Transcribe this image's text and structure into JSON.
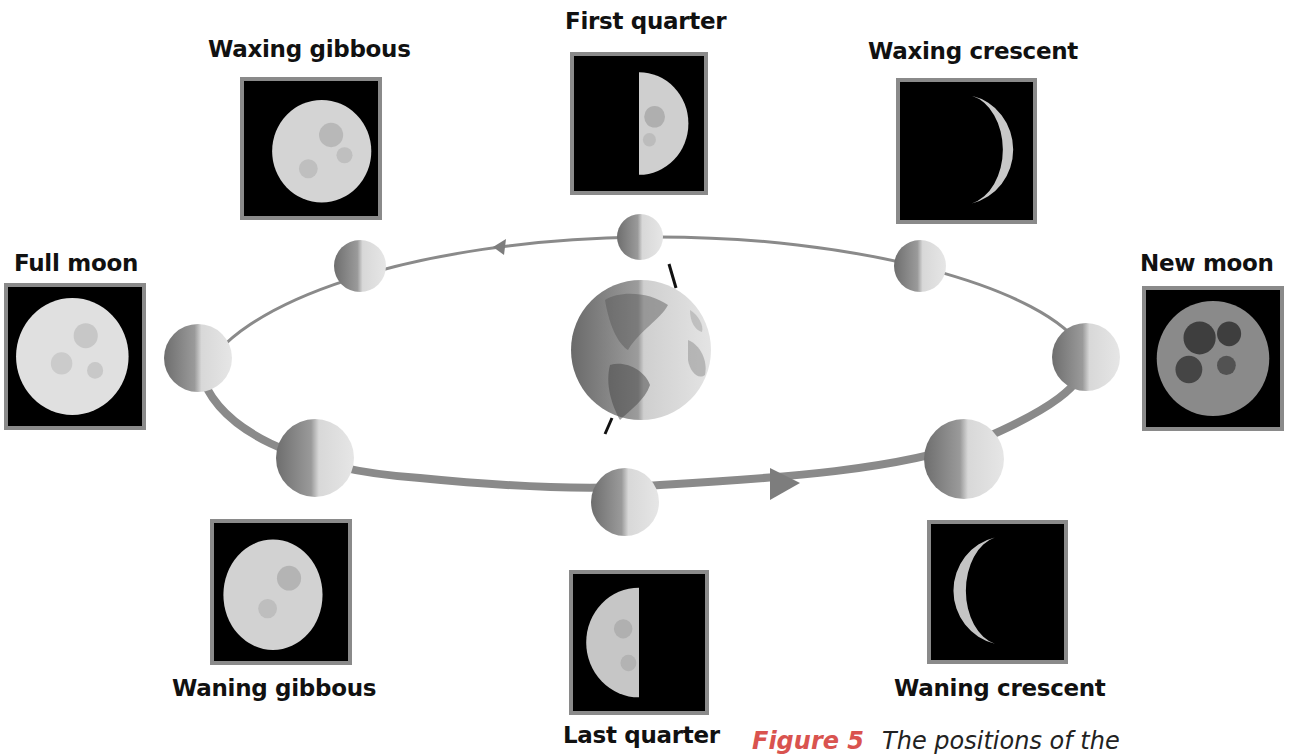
{
  "diagram": {
    "phases": [
      {
        "id": "first-quarter",
        "label": "First quarter"
      },
      {
        "id": "waxing-gibbous",
        "label": "Waxing gibbous"
      },
      {
        "id": "waxing-crescent",
        "label": "Waxing crescent"
      },
      {
        "id": "full-moon",
        "label": "Full moon"
      },
      {
        "id": "new-moon",
        "label": "New moon"
      },
      {
        "id": "waning-gibbous",
        "label": "Waning gibbous"
      },
      {
        "id": "last-quarter",
        "label": "Last quarter"
      },
      {
        "id": "waning-crescent",
        "label": "Waning crescent"
      }
    ],
    "center_body": "Earth",
    "orbit_direction": "counterclockwise"
  },
  "caption": {
    "figure_label": "Figure 5",
    "text": "The positions of the"
  },
  "colors": {
    "orbit_line": "#8a8a8a",
    "photo_border": "#8a8a8a",
    "photo_bg": "#000000",
    "caption_label": "#d9534f"
  }
}
